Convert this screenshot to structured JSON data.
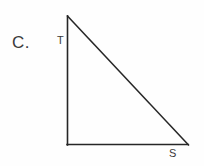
{
  "figure": {
    "item_letter": "C.",
    "background_color": "#fefefe",
    "stroke_color": "#262626",
    "label_color": "#3a3a3a",
    "shape_name": "right-triangle",
    "vertices": [
      {
        "name": "T",
        "label": "T",
        "x": 67,
        "y": 16
      },
      {
        "name": "right-angle-corner",
        "label": "",
        "x": 67,
        "y": 145
      },
      {
        "name": "S",
        "label": "S",
        "x": 188,
        "y": 145
      }
    ],
    "segments": [
      {
        "name": "vertical-leg",
        "from": "T",
        "to": "right-angle-corner"
      },
      {
        "name": "horizontal-leg",
        "from": "right-angle-corner",
        "to": "S"
      },
      {
        "name": "hypotenuse",
        "from": "T",
        "to": "S"
      }
    ],
    "labels": {
      "apex": "T",
      "base_right": "S"
    }
  }
}
